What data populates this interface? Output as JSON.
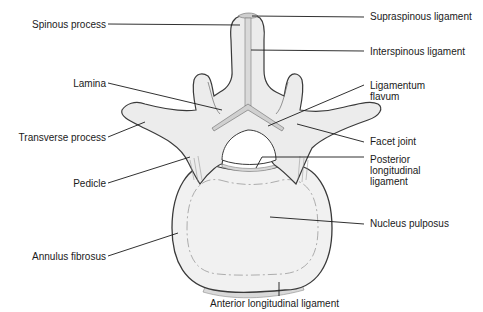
{
  "diagram": {
    "colors": {
      "bone_fill": "#ececec",
      "bone_stroke": "#4a4a4a",
      "disc_fill": "#f1f1f1",
      "ligament_fill": "#d9d9d9",
      "leader_line": "#1a1a1a",
      "text": "#1a1a1a"
    },
    "labels": {
      "spinous_process": "Spinous process",
      "lamina": "Lamina",
      "transverse_process": "Transverse process",
      "pedicle": "Pedicle",
      "annulus_fibrosus": "Annulus fibrosus",
      "supraspinous_ligament": "Supraspinous ligament",
      "interspinous_ligament": "Interspinous ligament",
      "ligamentum_flavum": "Ligamentum\nflavum",
      "facet_joint": "Facet joint",
      "posterior_longitudinal_ligament": "Posterior\nlongitudinal\nligament",
      "nucleus_pulposus": "Nucleus pulposus",
      "anterior_longitudinal_ligament": "Anterior longitudinal ligament"
    }
  }
}
